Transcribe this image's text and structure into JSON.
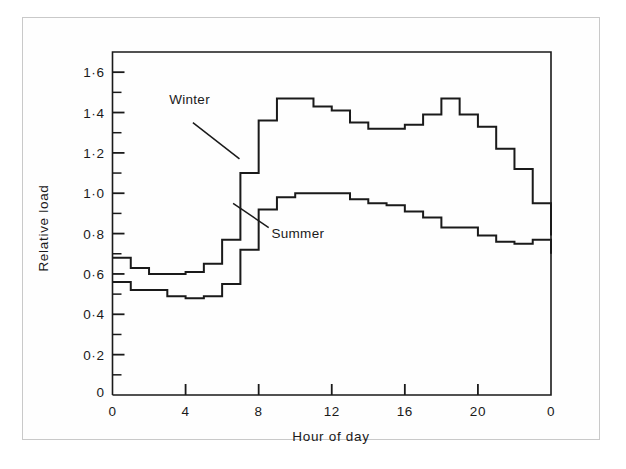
{
  "figure": {
    "background_color": "#ffffff",
    "frame_color": "#c9c9c9",
    "ink_color": "#1a1a1a"
  },
  "chart_data": {
    "type": "line",
    "subtype": "step",
    "title": "",
    "xlabel": "Hour of day",
    "ylabel": "Relative load",
    "xlim": [
      0,
      24
    ],
    "ylim": [
      0,
      1.7
    ],
    "xticks": [
      0,
      4,
      8,
      12,
      16,
      20,
      24
    ],
    "xtick_labels": [
      "0",
      "4",
      "8",
      "12",
      "16",
      "20",
      "0"
    ],
    "yticks": [
      0,
      0.2,
      0.4,
      0.6,
      0.8,
      1.0,
      1.2,
      1.4,
      1.6
    ],
    "ytick_labels": [
      "0",
      "0·2",
      "0·4",
      "0·6",
      "0·8",
      "1·0",
      "1·2",
      "1·4",
      "1·6"
    ],
    "yminor_step": 0.1,
    "grid": false,
    "legend": "inline-annotations",
    "x": [
      0,
      1,
      2,
      3,
      4,
      5,
      6,
      7,
      8,
      9,
      10,
      11,
      12,
      13,
      14,
      15,
      16,
      17,
      18,
      19,
      20,
      21,
      22,
      23
    ],
    "series": [
      {
        "name": "Winter",
        "label": "Winter",
        "color": "#1a1a1a",
        "values": [
          0.68,
          0.63,
          0.6,
          0.6,
          0.61,
          0.65,
          0.77,
          1.1,
          1.36,
          1.47,
          1.47,
          1.43,
          1.41,
          1.35,
          1.32,
          1.32,
          1.34,
          1.39,
          1.47,
          1.39,
          1.33,
          1.22,
          1.12,
          0.95
        ],
        "end_value": 0.79,
        "label_position": {
          "x": 3.1,
          "y": 1.44
        },
        "leader_from": {
          "x": 4.4,
          "y": 1.35
        },
        "leader_to": {
          "x": 6.95,
          "y": 1.17
        }
      },
      {
        "name": "Summer",
        "label": "Summer",
        "color": "#1a1a1a",
        "values": [
          0.56,
          0.52,
          0.52,
          0.49,
          0.48,
          0.49,
          0.55,
          0.72,
          0.92,
          0.98,
          1.0,
          1.0,
          1.0,
          0.97,
          0.95,
          0.94,
          0.91,
          0.88,
          0.83,
          0.83,
          0.79,
          0.76,
          0.75,
          0.77
        ],
        "end_value": 0.7,
        "label_position": {
          "x": 8.7,
          "y": 0.78
        },
        "leader_from": {
          "x": 8.55,
          "y": 0.83
        },
        "leader_to": {
          "x": 6.6,
          "y": 0.95
        }
      }
    ]
  },
  "annotations": {
    "winter_label": "Winter",
    "summer_label": "Summer",
    "x_axis_title": "Hour of day",
    "y_axis_title": "Relative load"
  }
}
